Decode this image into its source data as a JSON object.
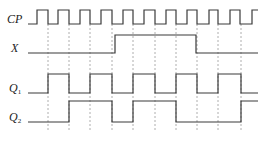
{
  "diagram": {
    "colors": {
      "trace": "#3a3a3a",
      "guide": "#9a9a9a",
      "background": "#ffffff"
    },
    "signals": [
      {
        "id": "CP",
        "label": "CP",
        "subscript": ""
      },
      {
        "id": "X",
        "label": "X",
        "subscript": ""
      },
      {
        "id": "Q1",
        "label": "Q",
        "subscript": "1"
      },
      {
        "id": "Q2",
        "label": "Q",
        "subscript": "2"
      }
    ],
    "x_start": 28,
    "x_end": 258,
    "clock": {
      "low_y": 24,
      "high_y": 10,
      "rising_edges": [
        37,
        58,
        80,
        101,
        123,
        144,
        166,
        187,
        209,
        230,
        252
      ],
      "falling_edges": [
        48,
        69,
        90,
        112,
        133,
        155,
        176,
        197,
        218,
        240,
        262
      ]
    },
    "guide_lines": [
      48,
      69,
      90,
      112,
      133,
      155,
      176,
      197,
      218,
      241
    ],
    "guide_top": 24,
    "guide_bottom": 132,
    "waveforms": {
      "X": {
        "low_y": 53,
        "high_y": 35,
        "initial": 0,
        "transitions": [
          115,
          196
        ]
      },
      "Q1": {
        "low_y": 93,
        "high_y": 74,
        "initial": 0,
        "transitions": [
          48,
          69,
          90,
          112,
          133,
          155,
          176,
          197,
          218,
          241
        ]
      },
      "Q2": {
        "low_y": 122,
        "high_y": 101,
        "initial": 0,
        "transitions": [
          69,
          112,
          133,
          176,
          241
        ]
      }
    }
  }
}
